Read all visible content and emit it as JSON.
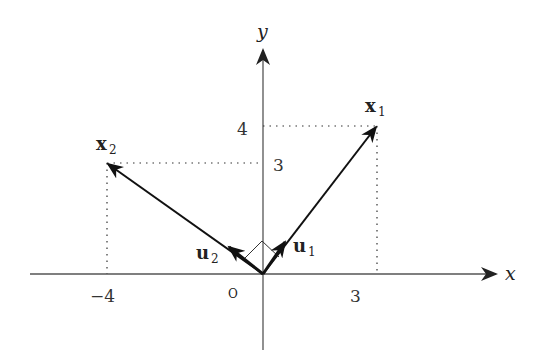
{
  "axes": {
    "x_label": "x",
    "y_label": "y",
    "origin_label": "O",
    "x_ticks": [
      {
        "value": -4,
        "label": "−4"
      },
      {
        "value": 3,
        "label": "3"
      }
    ],
    "y_ticks": [
      {
        "value": 4,
        "label": "4"
      },
      {
        "value": 3,
        "label": "3"
      }
    ]
  },
  "vectors": [
    {
      "name": "x1",
      "label_main": "x",
      "label_sub": "1",
      "x": 3,
      "y": 4
    },
    {
      "name": "x2",
      "label_main": "x",
      "label_sub": "2",
      "x": -4,
      "y": 3
    },
    {
      "name": "u1",
      "label_main": "u",
      "label_sub": "1",
      "x": 0.6,
      "y": 0.8,
      "unit": true
    },
    {
      "name": "u2",
      "label_main": "u",
      "label_sub": "2",
      "x": -0.8,
      "y": 0.6,
      "unit": true
    }
  ],
  "annotations": {
    "right_angle_between": [
      "u1",
      "u2"
    ]
  },
  "colors": {
    "axis": "#555555",
    "vector": "#111111",
    "guide": "#333333",
    "background": "#ffffff"
  }
}
